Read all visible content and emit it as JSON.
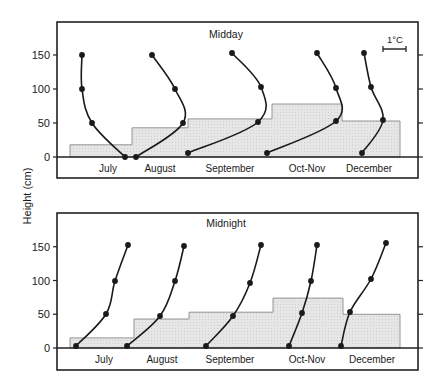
{
  "figure": {
    "ylabel": "Height (cm)",
    "scale_bar_label": "1°C",
    "colors": {
      "ink": "#1a1a1a",
      "fill": "#e6e6e6",
      "fill_stroke": "#8a8a8a",
      "frame": "#222222"
    }
  },
  "chart_data": [
    {
      "type": "line",
      "title": "Midday",
      "xlabel": "",
      "ylabel": "Height (cm)",
      "yticks": [
        0,
        50,
        100,
        150
      ],
      "ylim": [
        0,
        190
      ],
      "categories": [
        "July",
        "August",
        "September",
        "Oct-Nov",
        "December"
      ],
      "scale_bar": "1°C",
      "grid": false,
      "note": "Temperature profiles (relative, 1°C scale bar) at heights 0, 50, 100, 150 cm; shaded step bars show canopy height per period",
      "canopy_height_cm": [
        18,
        43,
        56,
        78,
        53
      ],
      "series": [
        {
          "name": "July",
          "heights": [
            150,
            100,
            50,
            0
          ],
          "points_px": [
            [
              82,
              55
            ],
            [
              82,
              89
            ],
            [
              92,
              123
            ],
            [
              125,
              157
            ]
          ]
        },
        {
          "name": "August",
          "heights": [
            150,
            100,
            50,
            0
          ],
          "points_px": [
            [
              152,
              55
            ],
            [
              175,
              89
            ],
            [
              183,
              123
            ],
            [
              136,
              157
            ]
          ]
        },
        {
          "name": "September",
          "heights": [
            150,
            100,
            50,
            0
          ],
          "points_px": [
            [
              232,
              53
            ],
            [
              261,
              87
            ],
            [
              258,
              122
            ],
            [
              188,
              153
            ]
          ]
        },
        {
          "name": "Oct-Nov",
          "heights": [
            150,
            100,
            50,
            0
          ],
          "points_px": [
            [
              317,
              53
            ],
            [
              336,
              88
            ],
            [
              336,
              121
            ],
            [
              267,
              153
            ]
          ]
        },
        {
          "name": "December",
          "heights": [
            150,
            100,
            50,
            0
          ],
          "points_px": [
            [
              364,
              53
            ],
            [
              371,
              87
            ],
            [
              383,
              120
            ],
            [
              362,
              153
            ]
          ]
        }
      ]
    },
    {
      "type": "line",
      "title": "Midnight",
      "xlabel": "",
      "ylabel": "Height (cm)",
      "yticks": [
        0,
        50,
        100,
        150
      ],
      "ylim": [
        0,
        190
      ],
      "categories": [
        "July",
        "August",
        "September",
        "Oct-Nov",
        "December"
      ],
      "grid": false,
      "canopy_height_cm": [
        15,
        43,
        53,
        74,
        50
      ],
      "series": [
        {
          "name": "July",
          "heights": [
            0,
            50,
            100,
            150
          ],
          "points_px": [
            [
              76,
              346
            ],
            [
              106,
              314
            ],
            [
              115,
              281
            ],
            [
              128,
              245
            ]
          ]
        },
        {
          "name": "August",
          "heights": [
            0,
            50,
            100,
            150
          ],
          "points_px": [
            [
              127,
              346
            ],
            [
              160,
              316
            ],
            [
              175,
              281
            ],
            [
              184,
              246
            ]
          ]
        },
        {
          "name": "September",
          "heights": [
            0,
            50,
            100,
            150
          ],
          "points_px": [
            [
              206,
              346
            ],
            [
              233,
              316
            ],
            [
              250,
              283
            ],
            [
              261,
              245
            ]
          ]
        },
        {
          "name": "Oct-Nov",
          "heights": [
            0,
            50,
            100,
            150
          ],
          "points_px": [
            [
              289,
              346
            ],
            [
              302,
              313
            ],
            [
              311,
              281
            ],
            [
              317,
              245
            ]
          ]
        },
        {
          "name": "December",
          "heights": [
            0,
            50,
            100,
            150
          ],
          "points_px": [
            [
              341,
              346
            ],
            [
              350,
              312
            ],
            [
              371,
              279
            ],
            [
              386,
              243
            ]
          ]
        }
      ]
    }
  ],
  "panels": [
    {
      "key": "midday",
      "frame": {
        "x": 57,
        "y": 22,
        "w": 361,
        "h": 156
      },
      "baseline_y": 157,
      "y_px_per_cm": 0.68,
      "title_pos": [
        226,
        38
      ],
      "tick_labels": [
        "0",
        "50",
        "100",
        "150"
      ],
      "month_labels": [
        {
          "text": "July",
          "x": 108
        },
        {
          "text": "August",
          "x": 160
        },
        {
          "text": "September",
          "x": 230
        },
        {
          "text": "Oct-Nov",
          "x": 307
        },
        {
          "text": "December",
          "x": 369
        }
      ],
      "steps": [
        {
          "x0": 70,
          "x1": 132
        },
        {
          "x0": 132,
          "x1": 188
        },
        {
          "x0": 188,
          "x1": 272
        },
        {
          "x0": 272,
          "x1": 342
        },
        {
          "x0": 342,
          "x1": 400
        }
      ]
    },
    {
      "key": "midnight",
      "frame": {
        "x": 57,
        "y": 213,
        "w": 361,
        "h": 157
      },
      "baseline_y": 348,
      "y_px_per_cm": 0.675,
      "title_pos": [
        226,
        227
      ],
      "tick_labels": [
        "0",
        "50",
        "100",
        "150"
      ],
      "month_labels": [
        {
          "text": "July",
          "x": 104
        },
        {
          "text": "August",
          "x": 162
        },
        {
          "text": "September",
          "x": 230
        },
        {
          "text": "Oct-Nov",
          "x": 307
        },
        {
          "text": "December",
          "x": 372
        }
      ],
      "steps": [
        {
          "x0": 70,
          "x1": 134
        },
        {
          "x0": 134,
          "x1": 189
        },
        {
          "x0": 189,
          "x1": 273
        },
        {
          "x0": 273,
          "x1": 343
        },
        {
          "x0": 343,
          "x1": 400
        }
      ]
    }
  ]
}
